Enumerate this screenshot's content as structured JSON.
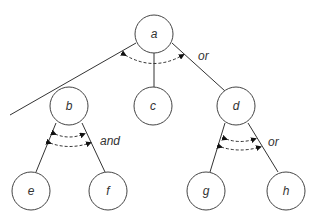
{
  "diagram": {
    "type": "and-or tree",
    "nodes": [
      {
        "id": "a",
        "label": "a",
        "x": 154,
        "y": 34
      },
      {
        "id": "b",
        "label": "b",
        "x": 69,
        "y": 106
      },
      {
        "id": "c",
        "label": "c",
        "x": 153,
        "y": 106
      },
      {
        "id": "d",
        "label": "d",
        "x": 236,
        "y": 106
      },
      {
        "id": "e",
        "label": "e",
        "x": 31,
        "y": 191
      },
      {
        "id": "f",
        "label": "f",
        "x": 108,
        "y": 191
      },
      {
        "id": "g",
        "label": "g",
        "x": 206,
        "y": 191
      },
      {
        "id": "h",
        "label": "h",
        "x": 286,
        "y": 191
      }
    ],
    "edges": [
      [
        "a",
        "b"
      ],
      [
        "a",
        "c"
      ],
      [
        "a",
        "d"
      ],
      [
        "b",
        "e"
      ],
      [
        "b",
        "f"
      ],
      [
        "d",
        "g"
      ],
      [
        "d",
        "h"
      ]
    ],
    "connectors": [
      {
        "parent": "a",
        "type": "or",
        "label": "or"
      },
      {
        "parent": "b",
        "type": "and",
        "label": "and"
      },
      {
        "parent": "d",
        "type": "or",
        "label": "or"
      }
    ]
  }
}
